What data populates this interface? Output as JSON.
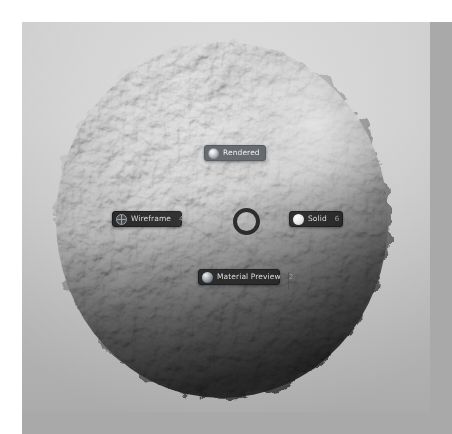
{
  "app": {
    "name": "Blender 3D Viewport",
    "viewport_label": "3D Viewport"
  },
  "scene": {
    "object_name": "Displaced Sphere",
    "background_description": "light gray studio gradient",
    "shading_mode_active": "Rendered"
  },
  "pie_menu": {
    "title": "View Shading",
    "center_name": "pie-menu-center",
    "items": [
      {
        "id": "rendered",
        "label": "Rendered",
        "shortcut": "8",
        "icon": "shading-rendered-icon",
        "highlighted": true
      },
      {
        "id": "wireframe",
        "label": "Wireframe",
        "shortcut": "4",
        "icon": "shading-wireframe-icon",
        "highlighted": false
      },
      {
        "id": "solid",
        "label": "Solid",
        "shortcut": "6",
        "icon": "shading-solid-icon",
        "highlighted": false
      },
      {
        "id": "material_preview",
        "label": "Material Preview",
        "shortcut": "2",
        "icon": "shading-material-preview-icon",
        "highlighted": false
      }
    ]
  },
  "colors": {
    "menu_background": "#232323",
    "menu_highlight": "#5c6166",
    "menu_text": "#dcdcdc",
    "menu_shortcut_text": "#9a9a9a",
    "viewport_top": "#dcdcdc",
    "viewport_bottom": "#b4b4b4",
    "page_backdrop": "#a9a9a9"
  }
}
